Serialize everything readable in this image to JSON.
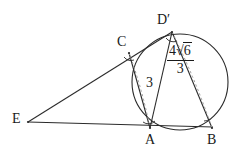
{
  "figure": {
    "type": "euclidean-geometry-diagram",
    "stroke_color": "#2b2b2b",
    "dashed_color": "#9a9a9a",
    "label_color": "#1a1a1a",
    "background": "#ffffff"
  },
  "points": [
    {
      "id": "E",
      "label": "E",
      "x": 28,
      "y": 122,
      "label_x": 12,
      "label_y": 114
    },
    {
      "id": "A",
      "label": "A",
      "x": 150,
      "y": 128,
      "label_x": 145,
      "label_y": 134
    },
    {
      "id": "B",
      "label": "B",
      "x": 212,
      "y": 128,
      "label_x": 207,
      "label_y": 134
    },
    {
      "id": "C",
      "label": "C",
      "x": 129,
      "y": 53,
      "label_x": 117,
      "label_y": 36
    },
    {
      "id": "D",
      "label": "D′",
      "x": 172,
      "y": 32,
      "label_x": 158,
      "label_y": 14
    }
  ],
  "circle": {
    "cx": 180,
    "cy": 82,
    "r": 48
  },
  "segments": [
    {
      "id": "E-D",
      "from": "E",
      "to": "D",
      "style": "solid"
    },
    {
      "id": "E-B",
      "from": "E",
      "to": "B",
      "style": "solid"
    },
    {
      "id": "C-A",
      "from": "C",
      "to": "A",
      "style": "solid"
    },
    {
      "id": "D-A",
      "from": "D",
      "to": "A",
      "style": "solid"
    },
    {
      "id": "D-B",
      "from": "D",
      "to": "B",
      "style": "solid"
    }
  ],
  "dashed_arcs": [
    {
      "id": "arc-C-A",
      "from": "C",
      "to": "A",
      "style": "dashed"
    },
    {
      "id": "arc-D-B",
      "from": "D",
      "to": "B",
      "style": "dashed"
    }
  ],
  "angle_marks": [
    {
      "id": "angle-at-C",
      "vertex": "C"
    },
    {
      "id": "angle-at-A",
      "vertex": "A"
    },
    {
      "id": "angle-at-B",
      "vertex": "B"
    },
    {
      "id": "angle-at-D",
      "vertex": "D"
    }
  ],
  "measurements": [
    {
      "id": "length-CA",
      "kind": "integer",
      "text": "3",
      "value": 3,
      "label_x": 146,
      "label_y": 78,
      "describes": "segment C-A"
    },
    {
      "id": "length-DB",
      "kind": "fraction-with-radical",
      "numerator": "4√6",
      "numerator_coefficient": "4",
      "radicand": "6",
      "denominator": "3",
      "text": "4√6/3",
      "label_x": 172,
      "label_y": 46,
      "describes": "segment D'-B"
    }
  ]
}
